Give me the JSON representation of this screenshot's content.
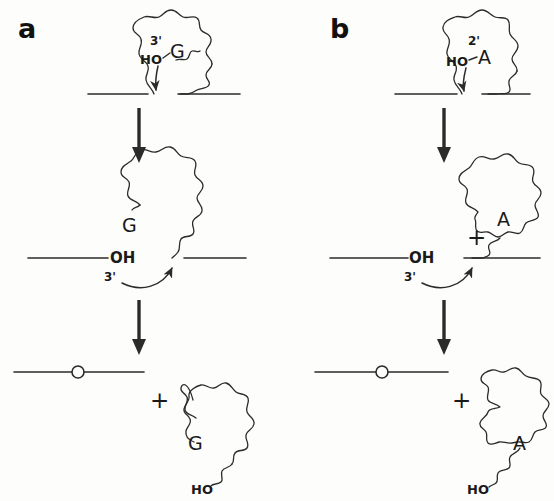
{
  "figure": {
    "background_color": "#fdfdfc",
    "ink_color": "#2b2b2b"
  },
  "panels": [
    {
      "id": "a",
      "label": "a",
      "mechanism": "Group I intron splicing initiated by exogenous guanosine 3'-OH attack",
      "stages": [
        {
          "id": "a-stage-1",
          "name": "precursor",
          "nucleotide": "G",
          "hydroxyl": "HO",
          "prime": "3'",
          "description": "Pre-mRNA with coiled intron; free guanosine 3'-OH attacks the 5' splice site"
        },
        {
          "id": "a-stage-2",
          "name": "intermediate",
          "nucleotide": "G",
          "hydroxyl": "OH",
          "prime": "3'",
          "description": "G joined to intron 5' end; free 3'-OH of upstream exon attacks the 3' splice site"
        },
        {
          "id": "a-stage-3",
          "name": "products",
          "plus": "+",
          "nucleotide": "G",
          "hydroxyl": "HO",
          "description": "Ligated exons plus linear excised intron with G at its 5' end and 3'-OH tail"
        }
      ]
    },
    {
      "id": "b",
      "label": "b",
      "mechanism": "Spliceosomal / group II intron splicing initiated by branch-point adenosine 2'-OH attack",
      "stages": [
        {
          "id": "b-stage-1",
          "name": "precursor",
          "nucleotide": "A",
          "hydroxyl": "HO",
          "prime": "2'",
          "description": "Pre-mRNA with coiled intron; branch adenosine 2'-OH attacks the 5' splice site"
        },
        {
          "id": "b-stage-2",
          "name": "intermediate",
          "nucleotide": "A",
          "hydroxyl": "OH",
          "prime": "3'",
          "plus": "+",
          "description": "Lariat intermediate formed at branch A; free 3'-OH of upstream exon attacks the 3' splice site"
        },
        {
          "id": "b-stage-3",
          "name": "products",
          "plus": "+",
          "nucleotide": "A",
          "hydroxyl": "HO",
          "description": "Ligated exons plus excised lariat intron branched at A with a 3'-OH tail"
        }
      ]
    }
  ],
  "glyphs": {
    "step_arrow": "downward-arrow",
    "curved_arrow": "nucleophilic-attack-arrow",
    "junction": "splice-junction-circle"
  }
}
